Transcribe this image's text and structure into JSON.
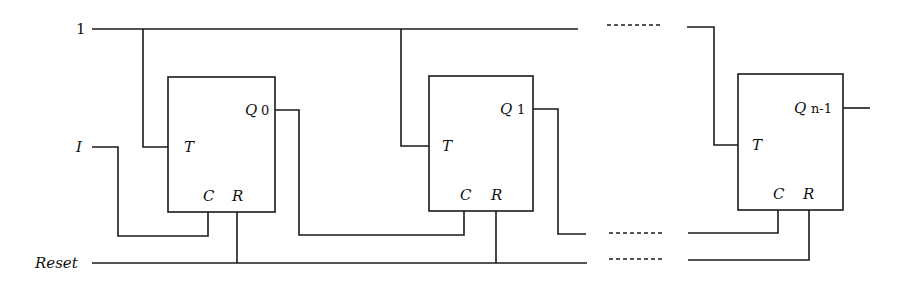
{
  "diagram": {
    "type": "circuit-schematic",
    "inputs": {
      "top_line_label": "1",
      "input_label": "I",
      "reset_label": "Reset"
    },
    "flipflops": [
      {
        "t_label": "T",
        "c_label": "C",
        "r_label": "R",
        "q_label": "Q",
        "q_index": "0"
      },
      {
        "t_label": "T",
        "c_label": "C",
        "r_label": "R",
        "q_label": "Q",
        "q_index": "1"
      },
      {
        "t_label": "T",
        "c_label": "C",
        "r_label": "R",
        "q_label": "Q",
        "q_index": "n-1"
      }
    ],
    "colors": {
      "line": "#1a1a1a",
      "background": "#ffffff"
    }
  }
}
